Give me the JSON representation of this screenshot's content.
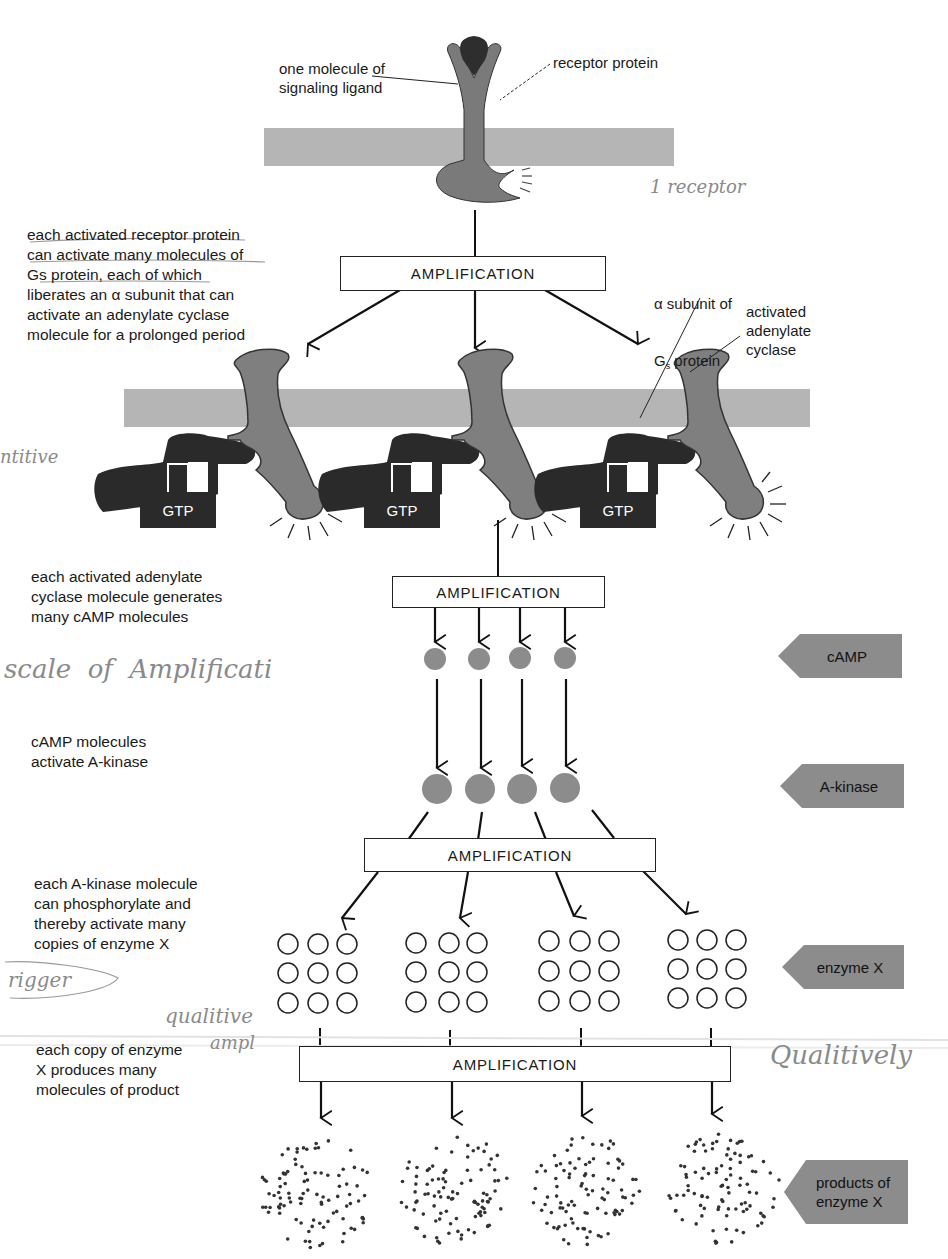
{
  "diagram": {
    "top": {
      "ligand_label": "one molecule of\nsignaling ligand",
      "receptor_label": "receptor protein"
    },
    "steps": [
      {
        "id": "receptor-step",
        "description": "each activated receptor protein\ncan activate many molecules of\nGs protein, each of which\nliberates an α subunit that can\nactivate an adenylate cyclase\nmolecule for a prolonged period"
      },
      {
        "id": "cyclase-step",
        "description": "each activated adenylate\ncyclase molecule generates\nmany cAMP molecules"
      },
      {
        "id": "camp-step",
        "description": "cAMP molecules\nactivate A-kinase"
      },
      {
        "id": "kinase-step",
        "description": "each A-kinase molecule\ncan phosphorylate and\nthereby activate many\ncopies of enzyme X"
      },
      {
        "id": "enzyme-step",
        "description": "each copy of enzyme\nX produces many\nmolecules of product"
      }
    ],
    "amplification_label": "AMPLIFICATION",
    "g_protein": {
      "alpha_label_line1": "α subunit of",
      "alpha_label_line2": "G",
      "alpha_label_sub": "s",
      "alpha_label_rest": " protein",
      "cyclase_label": "activated\nadenylate\ncyclase",
      "gtp_label": "GTP"
    },
    "side_tags": [
      {
        "name": "camp",
        "label": "cAMP"
      },
      {
        "name": "a-kinase",
        "label": "A-kinase"
      },
      {
        "name": "enzyme-x",
        "label": "enzyme X"
      },
      {
        "name": "products",
        "label": "products of\nenzyme X"
      }
    ],
    "handwritten_notes": {
      "receptor": "1 receptor",
      "left_margin": "ntitive",
      "scale": "scale  of  Amplificati",
      "trigger": "rigger",
      "qualitive": "qualitive",
      "ampl": "ampl",
      "qualitively": "Qualitively"
    },
    "counts": {
      "g_proteins": 3,
      "camp_molecules": 4,
      "a_kinase_molecules": 4,
      "enzyme_x_groups": 4,
      "enzyme_x_per_group": 9,
      "product_clusters": 4
    }
  },
  "colors": {
    "membrane": "#b5b5b5",
    "receptor": "#7a7a7a",
    "ligand": "#2e2e2e",
    "g_protein": "#2a2a2a",
    "cyclase": "#7f7f7f",
    "camp": "#8c8c8c",
    "tag": "#8c8c8c"
  }
}
